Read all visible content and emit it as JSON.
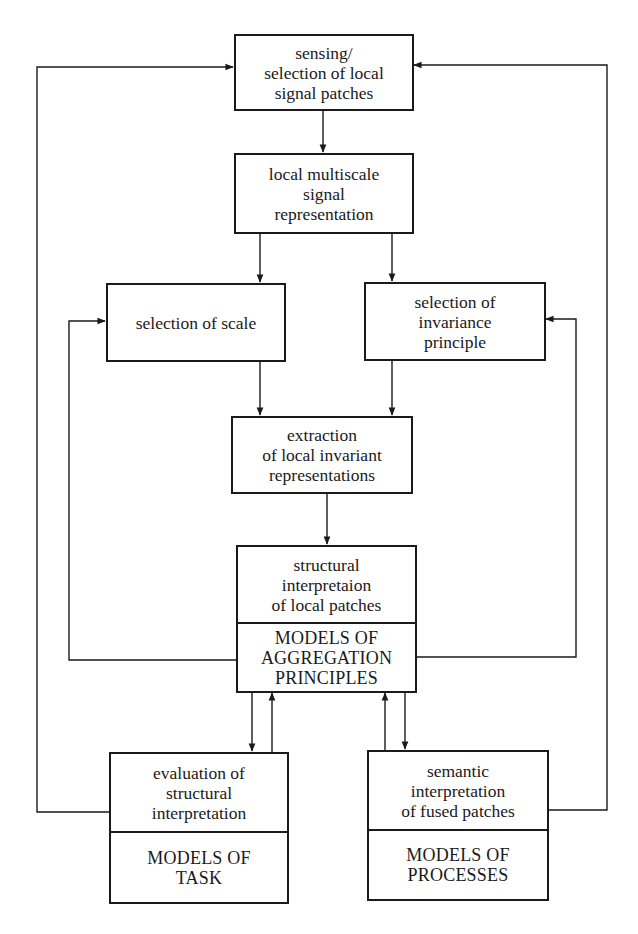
{
  "diagram": {
    "type": "flowchart",
    "boxes": {
      "sensing": {
        "label": "sensing/\nselection of local\nsignal patches"
      },
      "multiscale": {
        "label": "local multiscale\nsignal\nrepresentation"
      },
      "scale": {
        "label": "selection of scale"
      },
      "invariance": {
        "label": "selection of\ninvariance\nprinciple"
      },
      "extraction": {
        "label": "extraction\nof local invariant\nrepresentations"
      },
      "structural": {
        "label": "structural\ninterpretaion\nof local patches",
        "models": "MODELS OF\nAGGREGATION\nPRINCIPLES"
      },
      "evaluation": {
        "label": "evaluation of\nstructural\ninterpretation",
        "models": "MODELS OF\nTASK"
      },
      "semantic": {
        "label": "semantic\ninterpretation\nof fused patches",
        "models": "MODELS OF\nPROCESSES"
      }
    },
    "edges": [
      {
        "from": "sensing",
        "to": "multiscale"
      },
      {
        "from": "multiscale",
        "to": "scale"
      },
      {
        "from": "multiscale",
        "to": "invariance"
      },
      {
        "from": "scale",
        "to": "extraction"
      },
      {
        "from": "invariance",
        "to": "extraction"
      },
      {
        "from": "extraction",
        "to": "structural"
      },
      {
        "from": "structural",
        "to": "scale"
      },
      {
        "from": "structural",
        "to": "invariance"
      },
      {
        "from": "structural",
        "to": "evaluation"
      },
      {
        "from": "evaluation",
        "to": "structural"
      },
      {
        "from": "structural",
        "to": "semantic"
      },
      {
        "from": "semantic",
        "to": "structural"
      },
      {
        "from": "evaluation",
        "to": "sensing"
      },
      {
        "from": "semantic",
        "to": "sensing"
      }
    ],
    "colors": {
      "line": "#1a1a1a",
      "background": "#ffffff"
    }
  }
}
